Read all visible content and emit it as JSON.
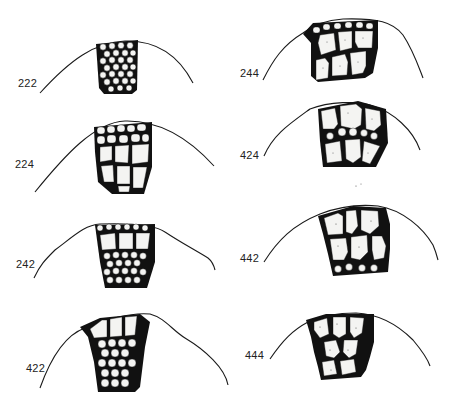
{
  "figure": {
    "panels": [
      {
        "id": "222",
        "label": "222",
        "column": "left",
        "row": 1,
        "cell_pattern": "small uniform cells throughout"
      },
      {
        "id": "224",
        "label": "224",
        "column": "left",
        "row": 2,
        "cell_pattern": "two rows small cells over larger cells"
      },
      {
        "id": "242",
        "label": "242",
        "column": "left",
        "row": 3,
        "cell_pattern": "small surface row, large middle row, small inner cells"
      },
      {
        "id": "422",
        "label": "422",
        "column": "left",
        "row": 4,
        "cell_pattern": "large surface row over small inner cells"
      },
      {
        "id": "244",
        "label": "244",
        "column": "right",
        "row": 1,
        "cell_pattern": "tiny surface row over large cells"
      },
      {
        "id": "424",
        "label": "424",
        "column": "right",
        "row": 2,
        "cell_pattern": "large surface row, small middle row, large inner row"
      },
      {
        "id": "442",
        "label": "442",
        "column": "right",
        "row": 3,
        "cell_pattern": "large surface and middle rows over small inner row"
      },
      {
        "id": "444",
        "label": "444",
        "column": "right",
        "row": 4,
        "cell_pattern": "large cells throughout"
      }
    ]
  },
  "colors": {
    "ink": "#111111",
    "cell_fill": "#f4f4f2",
    "background": "#ffffff"
  }
}
